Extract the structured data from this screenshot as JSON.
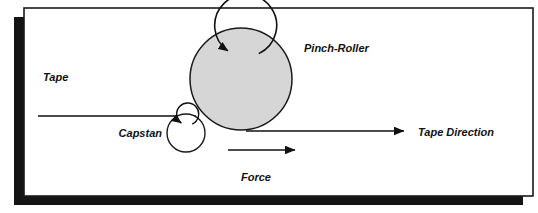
{
  "figure": {
    "kind": "mechanical-schematic",
    "background_color": "#ffffff"
  },
  "frame": {
    "border_color": "#1a1a1a",
    "shadow_color": "#141414",
    "fill_color": "#ffffff",
    "x": 24,
    "y": 8,
    "width": 509,
    "height": 188,
    "border_width": 1.6,
    "shadow_offset_x": -10,
    "shadow_offset_y": 9,
    "shadow_thickness": 10
  },
  "components": {
    "pinch_roller": {
      "label": "Pinch-Roller",
      "shape": "circle",
      "cx": 241,
      "cy": 79,
      "r": 51,
      "fill_color": "#d6d6d6",
      "stroke_color": "#1a1a1a",
      "stroke_width": 1.5,
      "rotation": "clockwise",
      "spin_arrow_radius": 31,
      "label_x": 304,
      "label_y": 52,
      "label_size": 11
    },
    "capstan": {
      "label": "Capstan",
      "shape": "circle",
      "cx": 186,
      "cy": 133,
      "r": 19,
      "fill_color": "#ffffff",
      "stroke_color": "#1a1a1a",
      "stroke_width": 1.4,
      "rotation": "clockwise",
      "spin_arrow_radius": 11,
      "label_x": 162,
      "label_y": 137,
      "label_anchor": "end",
      "label_size": 11
    }
  },
  "tape": {
    "label": "Tape",
    "label_x": 43,
    "label_y": 81,
    "label_size": 11,
    "line_color": "#111111",
    "line_width": 1.6,
    "path_start_x": 38,
    "path_y": 116,
    "path_end_x": 196
  },
  "arrows": {
    "tape_direction": {
      "label": "Tape Direction",
      "label_x": 418,
      "label_y": 136,
      "label_size": 11,
      "start_x": 246,
      "start_y": 131,
      "end_x": 404,
      "end_y": 131,
      "color": "#111111",
      "line_width": 1.7,
      "head_length": 13,
      "head_width": 9
    },
    "force": {
      "label": "Force",
      "label_x": 256,
      "label_y": 181,
      "label_size": 11,
      "start_x": 228,
      "start_y": 150,
      "end_x": 295,
      "end_y": 150,
      "color": "#111111",
      "line_width": 1.7,
      "head_length": 13,
      "head_width": 9
    }
  },
  "labels": {
    "tape": "Tape",
    "capstan": "Capstan",
    "pinch_roller": "Pinch-Roller",
    "force": "Force",
    "tape_direction": "Tape Direction"
  }
}
